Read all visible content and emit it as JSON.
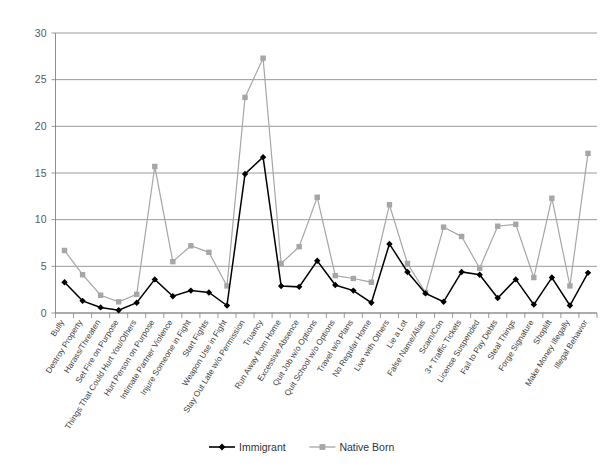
{
  "chart_data": {
    "type": "line",
    "title": "",
    "subtitle": "",
    "xlabel": "",
    "ylabel": "",
    "ylim": [
      0,
      30
    ],
    "ytick_labels": [
      "0",
      "5",
      "10",
      "15",
      "20",
      "25",
      "30"
    ],
    "ytick_values": [
      0,
      5,
      10,
      15,
      20,
      25,
      30
    ],
    "grid": true,
    "legend_position": "bottom",
    "categories": [
      "Bully",
      "Destroy Property",
      "Harass/Threaten",
      "Set Fire on Purpose",
      "Things That Could Hurt You/Others",
      "Hurt Person on Purpose",
      "Intimate Partner Violence",
      "Injure Someone in Fight",
      "Start Fights",
      "Weapon Use in Fight",
      "Stay Out Late w/o Permission",
      "Truancy",
      "Run Away from Home",
      "Excessive Absence",
      "Quit Job w/o Options",
      "Quit School w/o Options",
      "Travel w/o Plans",
      "No Regular Home",
      "Live with Others",
      "Lie a Lot",
      "False Name/Alias",
      "Scam/Con",
      "3+ Traffic Tickets",
      "License Suspended",
      "Fail to Pay Debts",
      "Steal Things",
      "Forge Signature",
      "Shoplift",
      "Make Money Illegally",
      "Illegal Behavior"
    ],
    "series": [
      {
        "name": "Immigrant",
        "color": "#000000",
        "marker": "diamond",
        "values": [
          3.3,
          1.3,
          0.6,
          0.3,
          1.1,
          3.6,
          1.8,
          2.4,
          2.2,
          0.8,
          14.9,
          16.7,
          2.9,
          2.8,
          5.6,
          3.0,
          2.4,
          1.1,
          7.4,
          4.4,
          2.1,
          1.2,
          4.4,
          4.1,
          1.6,
          3.6,
          0.9,
          3.8,
          0.8,
          4.3
        ]
      },
      {
        "name": "Native Born",
        "color": "#a6a6a6",
        "marker": "square",
        "values": [
          6.7,
          4.1,
          1.9,
          1.2,
          2.0,
          15.7,
          5.5,
          7.2,
          6.5,
          2.9,
          23.1,
          27.3,
          5.3,
          7.1,
          12.4,
          4.0,
          3.7,
          3.3,
          11.6,
          5.3,
          2.2,
          9.2,
          8.2,
          4.8,
          9.3,
          9.5,
          3.8,
          12.3,
          2.9,
          17.1
        ]
      }
    ]
  },
  "legend": {
    "items": [
      {
        "label": "Immigrant"
      },
      {
        "label": "Native Born"
      }
    ]
  },
  "colors": {
    "immigrant": "#000000",
    "native_born": "#a6a6a6",
    "grid": "#808285",
    "text": "#3f3f3f"
  }
}
